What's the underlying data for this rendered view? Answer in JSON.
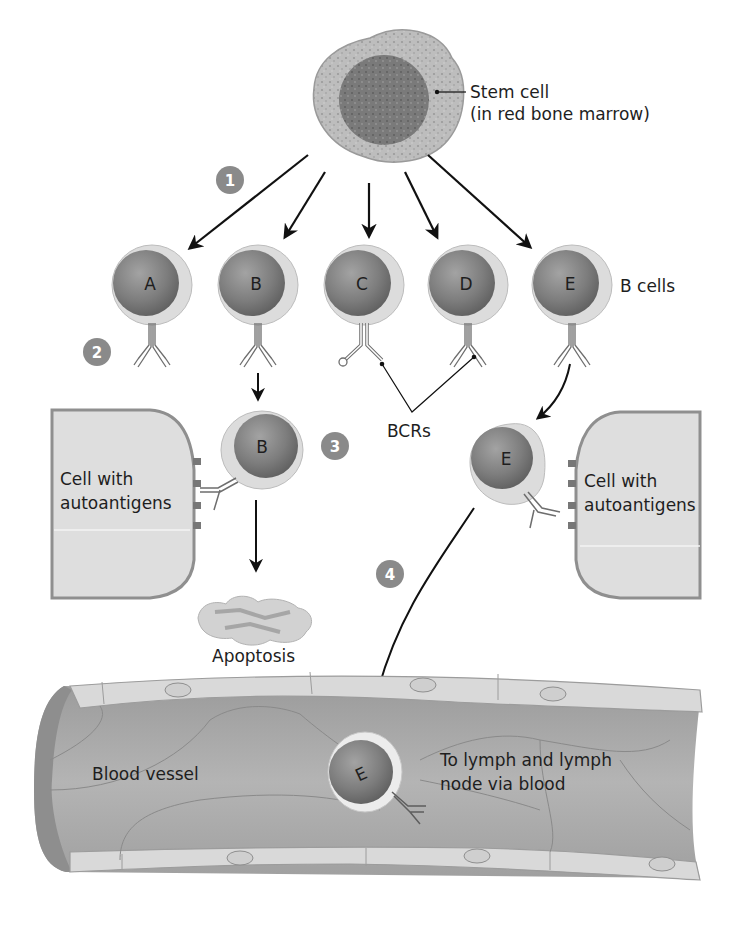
{
  "colors": {
    "background": "#ffffff",
    "stem_cytoplasm": "#b9b9b9",
    "nucleus": "#7c7c7c",
    "cell_membrane": "#d7d7d7",
    "step_badge": "#8a8a8a",
    "vessel_lumen": "#a9a9a9",
    "vessel_wall": "#d9d9d9",
    "arrow": "#111111"
  },
  "stem_cell": {
    "label_line1": "Stem cell",
    "label_line2": "(in red bone marrow)"
  },
  "steps": [
    {
      "number": "1"
    },
    {
      "number": "2"
    },
    {
      "number": "3"
    },
    {
      "number": "4"
    }
  ],
  "b_cells": {
    "group_label": "B cells",
    "cells": [
      {
        "letter": "A"
      },
      {
        "letter": "B"
      },
      {
        "letter": "C"
      },
      {
        "letter": "D"
      },
      {
        "letter": "E"
      }
    ]
  },
  "bcr_label": "BCRs",
  "selection": {
    "left_cell_letter": "B",
    "left_target_line1": "Cell with",
    "left_target_line2": "autoantigens",
    "right_cell_letter": "E",
    "right_target_line1": "Cell with",
    "right_target_line2": "autoantigens",
    "apoptosis_label": "Apoptosis"
  },
  "vessel": {
    "label": "Blood vessel",
    "cell_letter": "E",
    "destination_line1": "To lymph and lymph",
    "destination_line2": "node via blood"
  }
}
